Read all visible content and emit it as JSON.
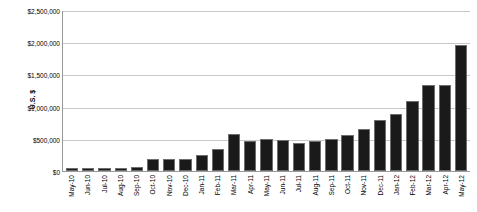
{
  "chart_data": {
    "type": "bar",
    "title": "",
    "xlabel": "",
    "ylabel": "U.S. $",
    "ylim": [
      0,
      2500000
    ],
    "grid": true,
    "legend": false,
    "y_ticks": [
      2500000,
      2000000,
      1500000,
      1000000,
      500000,
      0
    ],
    "y_tick_labels": [
      "$2,500,000",
      "$2,000,000",
      "$1,500,000",
      "$1,000,000",
      "$500,000",
      "$0"
    ],
    "categories": [
      "May-10",
      "Jun-10",
      "Jul-10",
      "Aug-10",
      "Sep-10",
      "Oct-10",
      "Nov-10",
      "Dec-10",
      "Jan-11",
      "Feb-11",
      "Mar-11",
      "Apr-11",
      "May-11",
      "Jun-11",
      "Jul-11",
      "Aug-11",
      "Sep-11",
      "Oct-11",
      "Nov-11",
      "Dec-11",
      "Jan-12",
      "Feb-12",
      "Mar-12",
      "Apr-12",
      "May-12"
    ],
    "values": [
      45000,
      50000,
      50000,
      50000,
      55000,
      185000,
      185000,
      180000,
      255000,
      345000,
      580000,
      460000,
      490000,
      480000,
      430000,
      460000,
      500000,
      560000,
      655000,
      790000,
      890000,
      1090000,
      1330000,
      1340000,
      1950000
    ],
    "bar_color": "#1a1a1a",
    "bar_edge_color": "#6e6e6e",
    "gridline_color": "#c8c8c8",
    "axis_color": "#9a9a9a",
    "background_color": "#ffffff"
  }
}
